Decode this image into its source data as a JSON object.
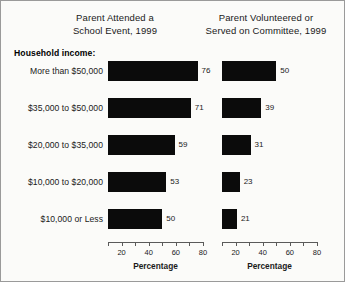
{
  "chart_data": {
    "type": "bar",
    "orientation": "horizontal",
    "group_heading": "Household income:",
    "categories": [
      "More than $50,000",
      "$35,000 to $50,000",
      "$20,000 to $35,000",
      "$10,000 to $20,000",
      "$10,000 or Less"
    ],
    "panels": [
      {
        "title_line1": "Parent Attended a",
        "title_line2": "School Event, 1999",
        "xlabel": "Percentage",
        "values": [
          76,
          71,
          59,
          53,
          50
        ]
      },
      {
        "title_line1": "Parent Volunteered or",
        "title_line2": "Served on Committee, 1999",
        "xlabel": "Percentage",
        "values": [
          50,
          39,
          31,
          23,
          21
        ]
      }
    ],
    "xlim": [
      10,
      80
    ],
    "xticks": [
      10,
      20,
      30,
      40,
      50,
      60,
      70,
      80
    ],
    "xtick_labels": [
      "",
      "20",
      "",
      "40",
      "",
      "60",
      "",
      "80"
    ],
    "grid": false,
    "legend": "none",
    "bar_color": "#0b0b0b"
  }
}
